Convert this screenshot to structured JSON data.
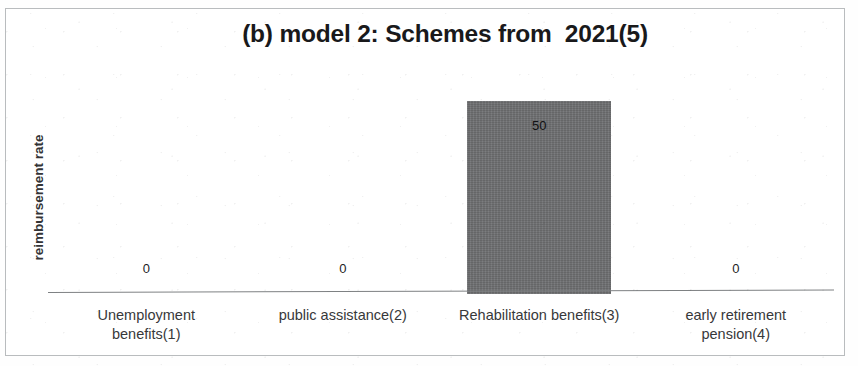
{
  "figure": {
    "frame_border_color": "#b9bcbe",
    "background": "#ffffff"
  },
  "chart_data": {
    "type": "bar",
    "title": "(b) model 2: Schemes from  2021(5)",
    "xlabel": "",
    "ylabel": "reimbursement rate",
    "categories": [
      "Unemployment benefits(1)",
      "public assistance(2)",
      "Rehabilitation benefits(3)",
      "early retirement pension(4)"
    ],
    "category_lines": [
      [
        "Unemployment",
        "benefits(1)"
      ],
      [
        "public assistance(2)"
      ],
      [
        "Rehabilitation benefits(3)"
      ],
      [
        "early retirement",
        "pension(4)"
      ]
    ],
    "values": [
      0,
      0,
      50,
      0
    ],
    "value_labels": [
      "0",
      "0",
      "50",
      "0"
    ],
    "ylim": [
      0,
      58
    ],
    "grid": false,
    "legend": false,
    "bar_color": "#6f7072",
    "axis_color": "#7e8183",
    "text_color": "#37383a"
  }
}
